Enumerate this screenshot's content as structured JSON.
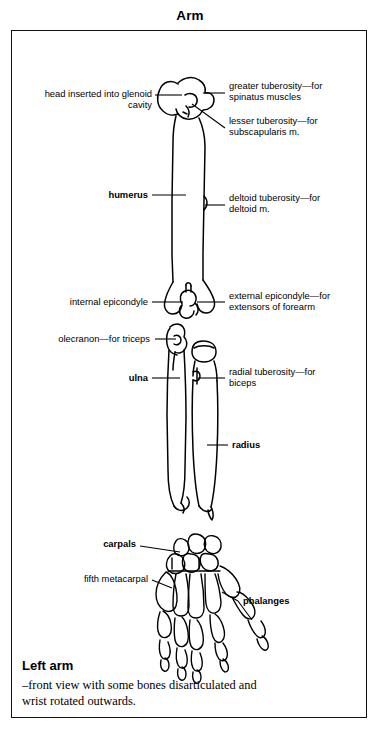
{
  "figure": {
    "title": "Arm",
    "domain": "anatomical-illustration"
  },
  "colors": {
    "ink": "#000000",
    "paper": "#ffffff",
    "frame": "#111111"
  },
  "labels": {
    "head_glenoid": "head inserted into glenoid\ncavity",
    "greater_tuberosity": "greater tuberosity—for\nspinatus muscles",
    "lesser_tuberosity": "lesser tuberosity—for\nsubscapularis m.",
    "humerus": "humerus",
    "deltoid_tuberosity": "deltoid tuberosity—for\ndeltoid m.",
    "internal_epicondyle": "internal epicondyle",
    "external_epicondyle": "external epicondyle—for\nextensors of forearm",
    "olecranon": "olecranon—for triceps",
    "ulna": "ulna",
    "radial_tuberosity": "radial tuberosity—for\nbiceps",
    "radius": "radius",
    "carpals": "carpals",
    "fifth_metacarpal": "fifth metacarpal",
    "phalanges": "phalanges"
  },
  "caption": {
    "heading": "Left arm",
    "body": "–front view with some bones disarticulated and\nwrist rotated outwards."
  },
  "anatomy_data": {
    "type": "labelled-diagram",
    "view": "anterior (front) view of left arm skeleton",
    "bones_depicted": [
      "humerus",
      "ulna",
      "radius",
      "carpals",
      "metacarpals",
      "phalanges"
    ],
    "callouts": [
      {
        "target": "humeral head",
        "side": "left",
        "bold": false
      },
      {
        "target": "greater tuberosity",
        "side": "right",
        "bold": false
      },
      {
        "target": "lesser tuberosity",
        "side": "right",
        "bold": false
      },
      {
        "target": "humerus shaft",
        "side": "left",
        "bold": true
      },
      {
        "target": "deltoid tuberosity",
        "side": "right",
        "bold": false
      },
      {
        "target": "internal epicondyle",
        "side": "left",
        "bold": false
      },
      {
        "target": "external epicondyle",
        "side": "right",
        "bold": false
      },
      {
        "target": "olecranon",
        "side": "left",
        "bold": false
      },
      {
        "target": "ulna",
        "side": "left",
        "bold": true
      },
      {
        "target": "radial tuberosity",
        "side": "right",
        "bold": false
      },
      {
        "target": "radius",
        "side": "right",
        "bold": true
      },
      {
        "target": "carpals",
        "side": "left",
        "bold": true
      },
      {
        "target": "fifth metacarpal",
        "side": "left",
        "bold": false
      },
      {
        "target": "phalanges",
        "side": "right",
        "bold": true
      }
    ]
  }
}
